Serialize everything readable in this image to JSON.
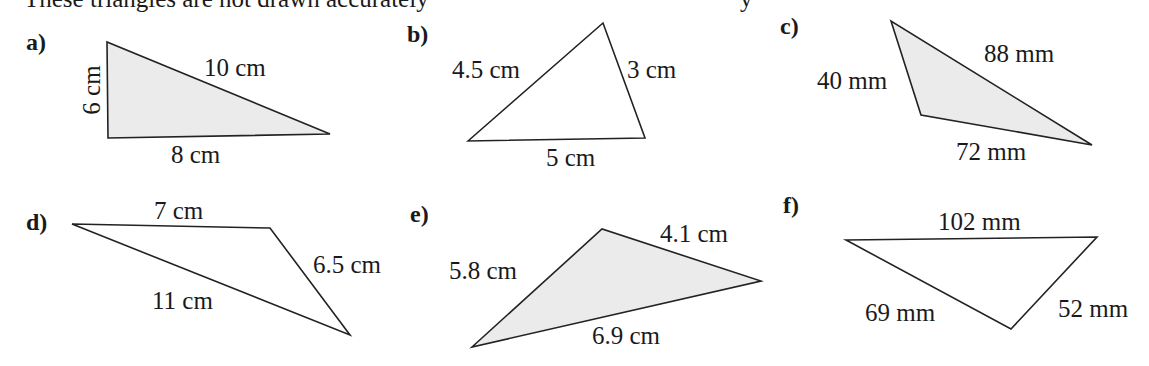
{
  "instruction": {
    "text": "These triangles are not drawn accurately",
    "tail_fragment": "y"
  },
  "colors": {
    "shaded_fill": "#ebebeb",
    "unshaded_fill": "#ffffff",
    "stroke": "#222222"
  },
  "triangles": [
    {
      "label": "a)",
      "shaded": true,
      "vertices": [
        [
          107,
          42
        ],
        [
          108,
          138
        ],
        [
          330,
          134
        ]
      ],
      "sides": [
        {
          "text": "6 cm",
          "x": 100,
          "y": 90,
          "rotate": -90
        },
        {
          "text": "10 cm",
          "x": 204,
          "y": 76,
          "rotate": 0
        },
        {
          "text": "8 cm",
          "x": 171,
          "y": 163,
          "rotate": 0
        }
      ]
    },
    {
      "label": "b)",
      "shaded": false,
      "vertices": [
        [
          468,
          141
        ],
        [
          603,
          23
        ],
        [
          645,
          138
        ]
      ],
      "sides": [
        {
          "text": "4.5 cm",
          "x": 452,
          "y": 78,
          "rotate": 0
        },
        {
          "text": "3 cm",
          "x": 627,
          "y": 78,
          "rotate": 0
        },
        {
          "text": "5 cm",
          "x": 546,
          "y": 166,
          "rotate": 0
        }
      ]
    },
    {
      "label": "c)",
      "shaded": true,
      "vertices": [
        [
          891,
          21
        ],
        [
          921,
          115
        ],
        [
          1092,
          145
        ]
      ],
      "sides": [
        {
          "text": "40 mm",
          "x": 817,
          "y": 89,
          "rotate": 0
        },
        {
          "text": "88 mm",
          "x": 984,
          "y": 62,
          "rotate": 0
        },
        {
          "text": "72 mm",
          "x": 956,
          "y": 160,
          "rotate": 0
        }
      ]
    },
    {
      "label": "d)",
      "shaded": false,
      "vertices": [
        [
          72,
          224
        ],
        [
          270,
          228
        ],
        [
          350,
          335
        ]
      ],
      "sides": [
        {
          "text": "7 cm",
          "x": 154,
          "y": 219,
          "rotate": 0
        },
        {
          "text": "6.5 cm",
          "x": 313,
          "y": 273,
          "rotate": 0
        },
        {
          "text": "11 cm",
          "x": 152,
          "y": 309,
          "rotate": 0
        }
      ]
    },
    {
      "label": "e)",
      "shaded": true,
      "vertices": [
        [
          472,
          347
        ],
        [
          602,
          229
        ],
        [
          761,
          281
        ]
      ],
      "sides": [
        {
          "text": "5.8 cm",
          "x": 449,
          "y": 279,
          "rotate": 0
        },
        {
          "text": "4.1 cm",
          "x": 660,
          "y": 242,
          "rotate": 0
        },
        {
          "text": "6.9 cm",
          "x": 592,
          "y": 344,
          "rotate": 0
        }
      ]
    },
    {
      "label": "f)",
      "shaded": false,
      "vertices": [
        [
          846,
          240
        ],
        [
          1097,
          237
        ],
        [
          1011,
          329
        ]
      ],
      "sides": [
        {
          "text": "102 mm",
          "x": 938,
          "y": 230,
          "rotate": 0
        },
        {
          "text": "69 mm",
          "x": 865,
          "y": 321,
          "rotate": 0
        },
        {
          "text": "52 mm",
          "x": 1058,
          "y": 317,
          "rotate": 0
        }
      ]
    }
  ],
  "part_label_positions": [
    {
      "x": 26,
      "y": 50
    },
    {
      "x": 407,
      "y": 42
    },
    {
      "x": 780,
      "y": 34
    },
    {
      "x": 26,
      "y": 230
    },
    {
      "x": 410,
      "y": 222
    },
    {
      "x": 783,
      "y": 213
    }
  ]
}
